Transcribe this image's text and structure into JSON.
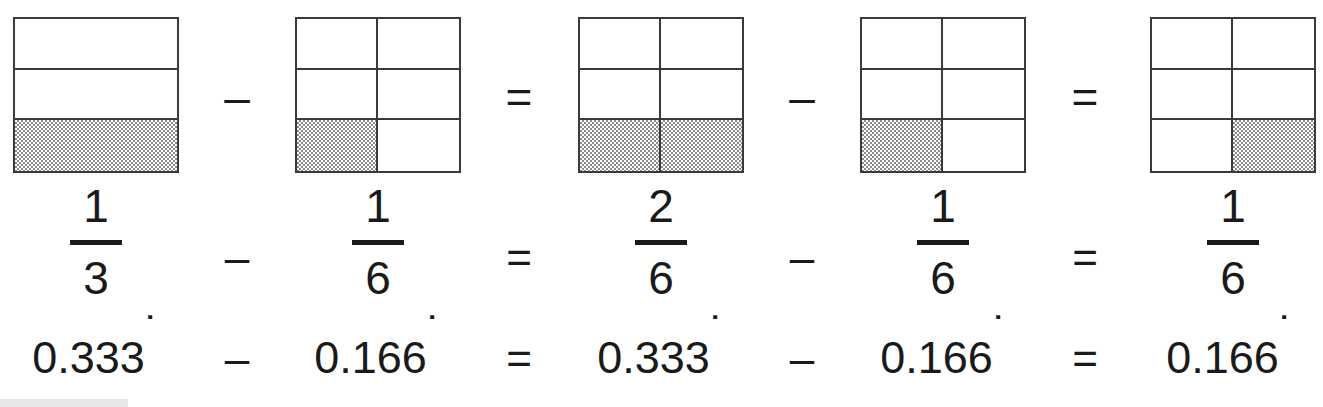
{
  "colors": {
    "ink": "#1a1a1a",
    "grid_line": "#3a3a3a",
    "shade_gray": "#8c8c8c",
    "background": "#ffffff"
  },
  "terms": [
    {
      "id": "term-1",
      "model": {
        "columns": 1,
        "rows": 3,
        "total_cells": 3,
        "shaded_cells": 1,
        "shaded_indices": [
          2
        ],
        "label": "one-third-area-model"
      },
      "fraction": {
        "numerator": "1",
        "denominator": "3"
      },
      "decimal": {
        "digits": "0.333",
        "recurring_dot": "˙"
      }
    },
    {
      "id": "term-2",
      "model": {
        "columns": 2,
        "rows": 3,
        "total_cells": 6,
        "shaded_cells": 1,
        "shaded_indices": [
          4
        ],
        "label": "one-sixth-area-model"
      },
      "fraction": {
        "numerator": "1",
        "denominator": "6"
      },
      "decimal": {
        "digits": "0.166",
        "recurring_dot": "˙"
      }
    },
    {
      "id": "term-3",
      "model": {
        "columns": 2,
        "rows": 3,
        "total_cells": 6,
        "shaded_cells": 2,
        "shaded_indices": [
          4,
          5
        ],
        "label": "two-sixths-area-model"
      },
      "fraction": {
        "numerator": "2",
        "denominator": "6"
      },
      "decimal": {
        "digits": "0.333",
        "recurring_dot": "˙"
      }
    },
    {
      "id": "term-4",
      "model": {
        "columns": 2,
        "rows": 3,
        "total_cells": 6,
        "shaded_cells": 1,
        "shaded_indices": [
          4
        ],
        "label": "one-sixth-area-model"
      },
      "fraction": {
        "numerator": "1",
        "denominator": "6"
      },
      "decimal": {
        "digits": "0.166",
        "recurring_dot": "˙"
      }
    },
    {
      "id": "term-5",
      "model": {
        "columns": 2,
        "rows": 3,
        "total_cells": 6,
        "shaded_cells": 1,
        "shaded_indices": [
          5
        ],
        "label": "one-sixth-area-model-right"
      },
      "fraction": {
        "numerator": "1",
        "denominator": "6"
      },
      "decimal": {
        "digits": "0.166",
        "recurring_dot": "˙"
      }
    }
  ],
  "operators": [
    {
      "id": "op-1",
      "symbol": "–",
      "name": "minus"
    },
    {
      "id": "op-2",
      "symbol": "=",
      "name": "equals"
    },
    {
      "id": "op-3",
      "symbol": "–",
      "name": "minus"
    },
    {
      "id": "op-4",
      "symbol": "=",
      "name": "equals"
    }
  ]
}
